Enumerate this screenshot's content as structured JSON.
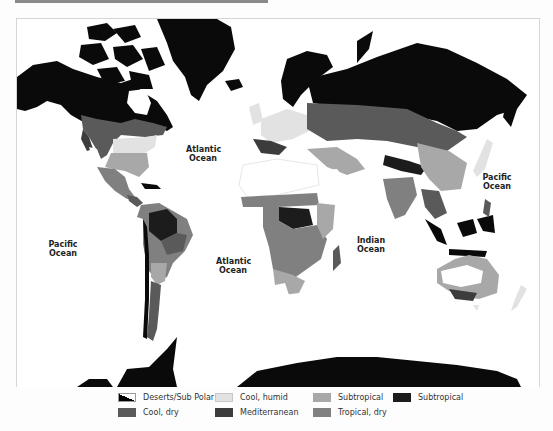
{
  "map": {
    "title": "World climate regions map",
    "ocean_labels": [
      {
        "text": "Atlantic\nOcean",
        "x": 202,
        "y": 145
      },
      {
        "text": "Pacific\nOcean",
        "x": 62,
        "y": 240
      },
      {
        "text": "Atlantic\nOcean",
        "x": 232,
        "y": 257
      },
      {
        "text": "Indian\nOcean",
        "x": 369,
        "y": 236
      },
      {
        "text": "Pacific\nOcean",
        "x": 496,
        "y": 173
      }
    ]
  },
  "legend": {
    "items": [
      {
        "label": "Deserts/Sub Polar",
        "color": "#000000",
        "pattern": "diagonal-split"
      },
      {
        "label": "Cool, dry",
        "color": "#5a5a5a"
      },
      {
        "label": "Cool, humid",
        "color": "#e2e2e2"
      },
      {
        "label": "Mediterranean",
        "color": "#3c3c3c"
      },
      {
        "label": "Subtropical",
        "color": "#a8a8a8"
      },
      {
        "label": "Tropical, dry",
        "color": "#808080"
      },
      {
        "label": "Subtropical",
        "color": "#1c1c1c"
      }
    ]
  },
  "colors": {
    "land_black": "#0a0a0a",
    "cool_dry": "#5a5a5a",
    "cool_humid": "#e2e2e2",
    "mediterranean": "#3c3c3c",
    "subtropical_light": "#a8a8a8",
    "tropical_dry": "#808080",
    "subtropical_dark": "#1c1c1c",
    "desert": "#ffffff"
  }
}
